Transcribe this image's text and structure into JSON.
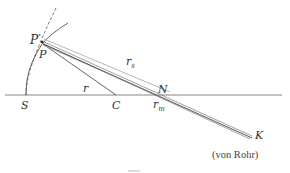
{
  "diagram": {
    "type": "optical-geometry",
    "points": {
      "P_prime": {
        "label": "P′",
        "x": 42,
        "y": 42
      },
      "P": {
        "label": "P",
        "x": 43,
        "y": 44
      },
      "S": {
        "label": "S",
        "x": 26,
        "y": 95
      },
      "C": {
        "label": "C",
        "x": 116,
        "y": 95
      },
      "N": {
        "label": "N",
        "x": 161,
        "y": 95
      },
      "K": {
        "label": "K",
        "x": 252,
        "y": 138
      }
    },
    "labels": {
      "P_prime": "P′",
      "P": "P",
      "S": "S",
      "C": "C",
      "N": "N",
      "K": "K",
      "r": "r",
      "r_s": "r",
      "r_s_sub": "s",
      "r_m": "r",
      "r_m_sub": "m"
    },
    "caption": "(von Rohr)",
    "colors": {
      "line": "#555555",
      "axis": "#666666",
      "text": "#333333"
    }
  }
}
